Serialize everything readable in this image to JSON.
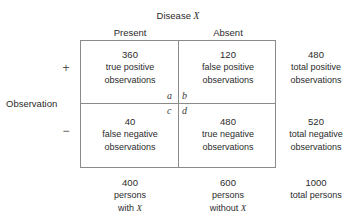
{
  "figure": {
    "column_group_title": "Disease",
    "column_group_title_var": "X",
    "row_group_title": "Observation",
    "columns": [
      {
        "label": "Present"
      },
      {
        "label": "Absent"
      }
    ],
    "rows": [
      {
        "sign": "+"
      },
      {
        "sign": "−"
      }
    ]
  },
  "cells": {
    "a": {
      "letter": "a",
      "count": "360",
      "line1": "true positive",
      "line2": "observations"
    },
    "b": {
      "letter": "b",
      "count": "120",
      "line1": "false positive",
      "line2": "observations"
    },
    "c": {
      "letter": "c",
      "count": "40",
      "line1": "false negative",
      "line2": "observations"
    },
    "d": {
      "letter": "d",
      "count": "480",
      "line1": "true negative",
      "line2": "observations"
    }
  },
  "row_totals": [
    {
      "count": "480",
      "line1": "total positive",
      "line2": "observations"
    },
    {
      "count": "520",
      "line1": "total negative",
      "line2": "observations"
    }
  ],
  "column_totals": [
    {
      "count": "400",
      "line1": "persons",
      "line2_prefix": "with ",
      "line2_var": "X"
    },
    {
      "count": "600",
      "line1": "persons",
      "line2_prefix": "without ",
      "line2_var": "X"
    }
  ],
  "grand_total": {
    "count": "1000",
    "label": "total persons"
  },
  "colors": {
    "text": "#2b2b2b",
    "rule": "#8a8a8a",
    "background": "#ffffff"
  }
}
